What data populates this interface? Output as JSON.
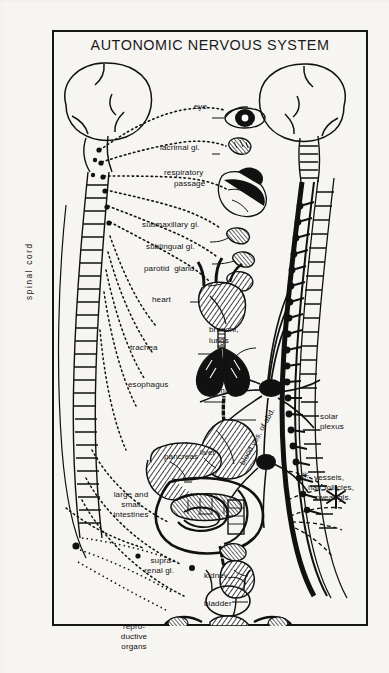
{
  "plate": {
    "title": "AUTONOMIC NERVOUS SYSTEM",
    "background_color": "#f6f5f2",
    "ink_color": "#111111",
    "frame_color": "#151515"
  },
  "axis_labels": {
    "spinal_cord": "spinal cord",
    "blood_vessels_abdomen": "blood ves. of abd."
  },
  "labels": {
    "eye": "eye",
    "lacrimal": "lacrimal gl.",
    "respiratory_1": "respiratory",
    "respiratory_2": "passage",
    "submaxillary": "submaxillary gl.",
    "sublingual": "sublingual gl.",
    "parotid": "parotid  gland",
    "heart": "heart",
    "bronchi_1": "bronchi,",
    "bronchi_2": "lungs",
    "trachea": "trachea",
    "esophagus": "esophagus",
    "stomach": "stomach",
    "liver": "liver",
    "pancreas": "pancreas",
    "intestines_1": "large and",
    "intestines_2": "small",
    "intestines_3": "intestines",
    "suprarenal_1": "supra-",
    "suprarenal_2": "renal gl.",
    "kidney": "kidney",
    "bladder": "bladder",
    "reproductive_1": "repro-",
    "reproductive_2": "ductive",
    "reproductive_3": "organs",
    "solar_1": "solar",
    "solar_2": "plexus",
    "asterisk": "✳",
    "skin_1": "vessels,",
    "skin_2": "hair follicles,",
    "skin_3": "sweat gls."
  }
}
